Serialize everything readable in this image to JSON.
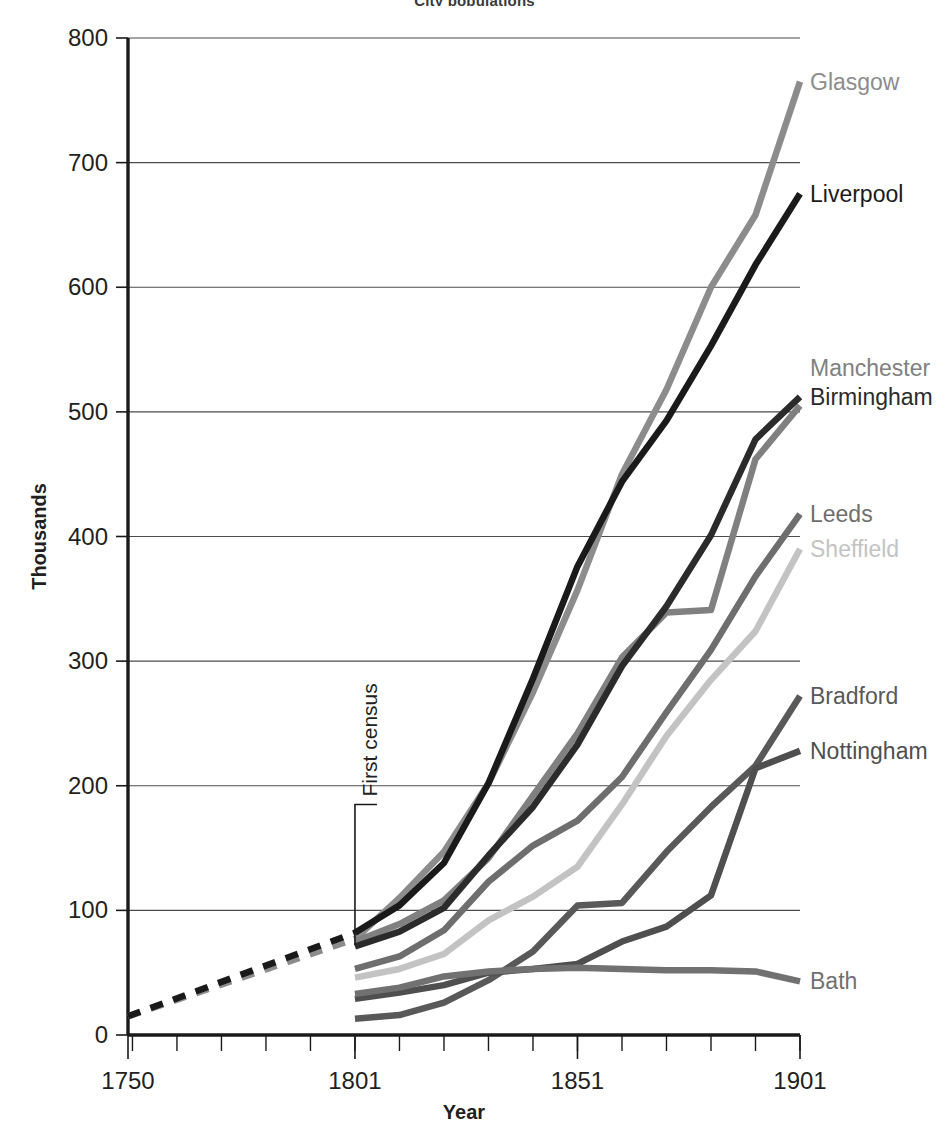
{
  "chart_title": "City populations",
  "axes": {
    "x_title": "Year",
    "y_title": "Thousands",
    "x_ticks": [
      "1750",
      "1801",
      "1851",
      "1901"
    ],
    "x_tick_values": [
      1750,
      1801,
      1851,
      1901
    ],
    "y_ticks": [
      "0",
      "100",
      "200",
      "300",
      "400",
      "500",
      "600",
      "700",
      "800"
    ],
    "x_minor_step": 10,
    "x_minor_first": 1751
  },
  "annotation": {
    "label": "First census",
    "year": 1801,
    "orientation": "vertical"
  },
  "colors": {
    "glasgow": "#8c8c8c",
    "liverpool": "#1a1a1a",
    "manchester": "#808080",
    "birmingham": "#2b2b2b",
    "leeds": "#6e6e6e",
    "sheffield": "#c3c3c3",
    "bradford": "#595959",
    "nottingham": "#4f4f4f",
    "bath": "#717171",
    "gridline": "#4c4c4c",
    "axis": "#1a1a1a",
    "background": "#ffffff"
  },
  "chart_data": {
    "type": "line",
    "title": "City populations",
    "xlabel": "Year",
    "ylabel": "Thousands",
    "xlim": [
      1750,
      1901
    ],
    "ylim": [
      0,
      800
    ],
    "grid": true,
    "legend": "right-inline-labels",
    "x": [
      1801,
      1811,
      1821,
      1831,
      1841,
      1851,
      1861,
      1871,
      1881,
      1891,
      1901
    ],
    "pre_census_x": [
      1750,
      1801
    ],
    "series": [
      {
        "name": "Glasgow",
        "color": "#8c8c8c",
        "label_position": {
          "x": 1901,
          "y": 765
        },
        "pre_census_dashed": [
          15,
          77
        ],
        "values": [
          77,
          110,
          147,
          202,
          275,
          357,
          450,
          518,
          600,
          658,
          765
        ]
      },
      {
        "name": "Liverpool",
        "color": "#1a1a1a",
        "label_position": {
          "x": 1901,
          "y": 675
        },
        "pre_census_dashed": [
          15,
          82
        ],
        "values": [
          82,
          104,
          138,
          202,
          286,
          376,
          444,
          493,
          553,
          618,
          675
        ]
      },
      {
        "name": "Manchester",
        "color": "#808080",
        "label_position": {
          "x": 1901,
          "y": 535
        },
        "pre_census_dashed": null,
        "values": [
          75,
          89,
          108,
          142,
          192,
          242,
          303,
          339,
          341,
          462,
          505
        ]
      },
      {
        "name": "Birmingham",
        "color": "#2b2b2b",
        "label_position": {
          "x": 1901,
          "y": 512
        },
        "pre_census_dashed": null,
        "values": [
          71,
          83,
          102,
          144,
          183,
          233,
          296,
          344,
          401,
          478,
          512
        ]
      },
      {
        "name": "Leeds",
        "color": "#6e6e6e",
        "label_position": {
          "x": 1901,
          "y": 418
        },
        "pre_census_dashed": null,
        "values": [
          53,
          63,
          84,
          123,
          152,
          172,
          207,
          259,
          309,
          368,
          418
        ]
      },
      {
        "name": "Sheffield",
        "color": "#c3c3c3",
        "label_position": {
          "x": 1901,
          "y": 390
        },
        "pre_census_dashed": null,
        "values": [
          46,
          53,
          65,
          92,
          111,
          135,
          185,
          240,
          285,
          324,
          390
        ]
      },
      {
        "name": "Bradford",
        "color": "#595959",
        "label_position": {
          "x": 1901,
          "y": 272
        },
        "pre_census_dashed": null,
        "values": [
          13,
          16,
          26,
          44,
          67,
          104,
          106,
          147,
          183,
          216,
          272
        ]
      },
      {
        "name": "Nottingham",
        "color": "#4f4f4f",
        "label_position": {
          "x": 1901,
          "y": 228
        },
        "pre_census_dashed": null,
        "values": [
          29,
          34,
          40,
          50,
          53,
          57,
          75,
          87,
          112,
          214,
          228
        ]
      },
      {
        "name": "Bath",
        "color": "#717171",
        "label_position": {
          "x": 1901,
          "y": 43
        },
        "pre_census_dashed": null,
        "values": [
          33,
          38,
          47,
          51,
          53,
          54,
          53,
          52,
          52,
          51,
          43
        ]
      }
    ]
  }
}
